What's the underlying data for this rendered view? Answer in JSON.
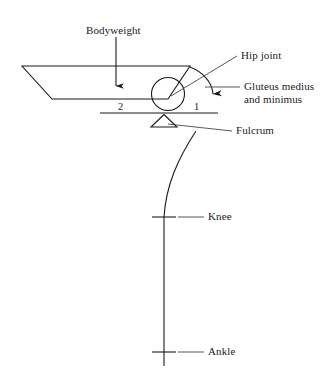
{
  "figure": {
    "background_color": "#ffffff",
    "ink_color": "#1a1a1a"
  },
  "labels": {
    "bodyweight": "Bodyweight",
    "hip_joint": "Hip joint",
    "gluteus_line1": "Gluteus medius",
    "gluteus_line2": "and minimus",
    "fulcrum": "Fulcrum",
    "knee": "Knee",
    "ankle": "Ankle"
  },
  "lever_arms": {
    "load_arm": "2",
    "effort_arm": "1"
  },
  "parts": [
    {
      "name": "pelvis",
      "shape": "trapezoid"
    },
    {
      "name": "femoral-head",
      "shape": "circle"
    },
    {
      "name": "lever-bar",
      "shape": "line"
    },
    {
      "name": "fulcrum-triangle",
      "shape": "triangle"
    },
    {
      "name": "femur",
      "shape": "curve"
    },
    {
      "name": "tibia",
      "shape": "line"
    },
    {
      "name": "knee-marker",
      "shape": "tick"
    },
    {
      "name": "ankle-marker",
      "shape": "tick"
    }
  ],
  "arrows": {
    "bodyweight_direction": "down",
    "gluteus_direction": "curved-down"
  }
}
